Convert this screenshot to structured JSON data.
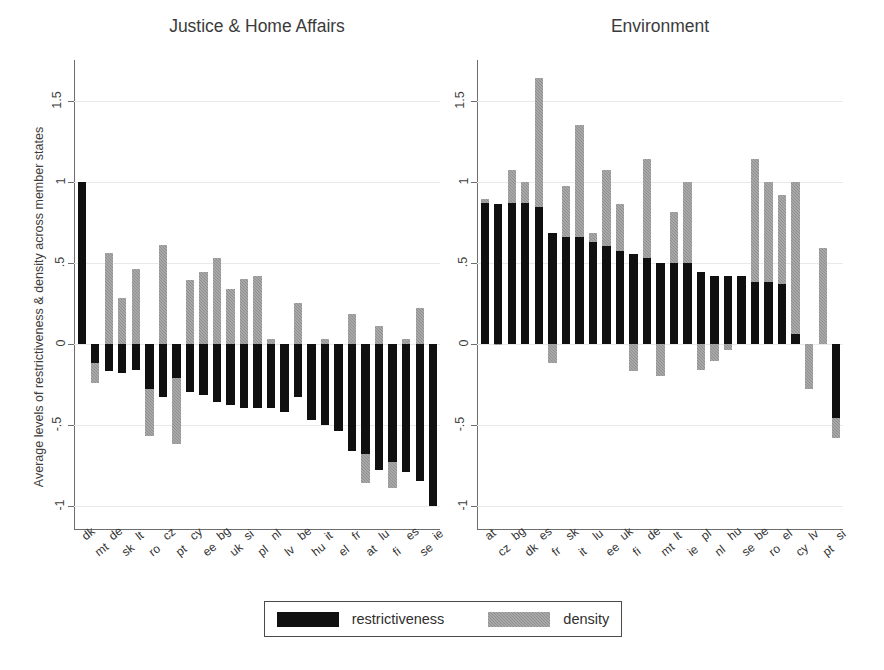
{
  "figure": {
    "y_axis_title": "Average levels of restrictiveness & density across member states",
    "y_ticks": [
      "1.5",
      "1",
      ".5",
      "0",
      "-.5",
      "-1"
    ],
    "legend": {
      "restrictiveness_label": "restrictiveness",
      "density_label": "density",
      "restrictiveness_color": "#101010",
      "density_color": "#8f8f8f"
    }
  },
  "chart_data": [
    {
      "type": "bar",
      "title": "Justice & Home Affairs",
      "xlabel": "",
      "ylabel": "Average levels of restrictiveness & density across member states",
      "ylim": [
        -1.15,
        1.75
      ],
      "yticks": [
        1.5,
        1,
        0.5,
        0,
        -0.5,
        -1
      ],
      "grid": true,
      "legend_position": "bottom-center",
      "categories": [
        "dk",
        "mt",
        "de",
        "sk",
        "lt",
        "ro",
        "cz",
        "pt",
        "cy",
        "ee",
        "bg",
        "uk",
        "si",
        "pl",
        "nl",
        "lv",
        "be",
        "hu",
        "it",
        "el",
        "fr",
        "at",
        "lu",
        "fi",
        "es",
        "se",
        "ie"
      ],
      "series": [
        {
          "name": "restrictiveness",
          "values": [
            1.0,
            -0.12,
            -0.17,
            -0.18,
            -0.16,
            -0.28,
            -0.33,
            -0.21,
            -0.3,
            -0.32,
            -0.36,
            -0.38,
            -0.4,
            -0.4,
            -0.4,
            -0.42,
            -0.33,
            -0.47,
            -0.5,
            -0.54,
            -0.66,
            -0.68,
            -0.78,
            -0.73,
            -0.79,
            -0.85,
            -1.0
          ]
        },
        {
          "name": "density",
          "values": [
            0.0,
            -0.24,
            0.56,
            0.28,
            0.46,
            -0.57,
            0.61,
            -0.62,
            0.39,
            0.44,
            0.53,
            0.34,
            0.4,
            0.42,
            0.03,
            -0.02,
            0.25,
            -0.44,
            0.03,
            -0.02,
            0.18,
            -0.86,
            0.11,
            -0.89,
            0.03,
            0.22,
            0.0
          ]
        }
      ]
    },
    {
      "type": "bar",
      "title": "Environment",
      "xlabel": "",
      "ylabel": "",
      "ylim": [
        -1.15,
        1.75
      ],
      "yticks": [
        1.5,
        1,
        0.5,
        0,
        -0.5,
        -1
      ],
      "grid": true,
      "categories": [
        "at",
        "cz",
        "bg",
        "dk",
        "es",
        "fr",
        "sk",
        "it",
        "lu",
        "ee",
        "uk",
        "fi",
        "de",
        "mt",
        "lt",
        "ie",
        "pl",
        "nl",
        "hu",
        "se",
        "be",
        "ro",
        "el",
        "cy",
        "lv",
        "pt",
        "si"
      ],
      "series": [
        {
          "name": "restrictiveness",
          "values": [
            0.87,
            0.86,
            0.87,
            0.87,
            0.84,
            0.68,
            0.66,
            0.66,
            0.63,
            0.6,
            0.57,
            0.55,
            0.53,
            0.5,
            0.5,
            0.5,
            0.44,
            0.42,
            0.42,
            0.42,
            0.38,
            0.38,
            0.37,
            0.06,
            0.0,
            0.0,
            -0.46
          ]
        },
        {
          "name": "density",
          "values": [
            0.89,
            -0.01,
            1.07,
            1.0,
            1.64,
            -0.12,
            0.97,
            1.35,
            0.68,
            1.07,
            0.86,
            -0.17,
            1.14,
            -0.2,
            0.81,
            1.0,
            -0.16,
            -0.11,
            -0.04,
            0.0,
            1.14,
            1.0,
            0.92,
            1.0,
            -0.28,
            0.59,
            -0.58
          ]
        }
      ]
    }
  ]
}
